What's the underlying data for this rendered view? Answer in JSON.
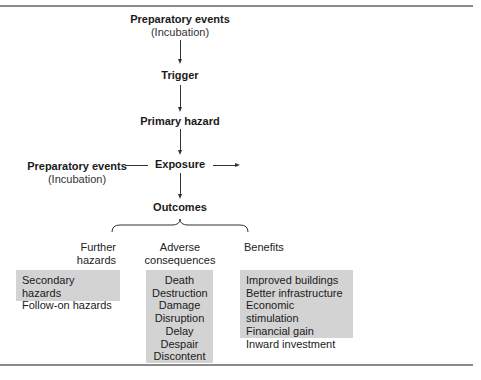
{
  "diagram": {
    "nodes": {
      "preparatory_top": {
        "label": "Preparatory events",
        "sublabel": "(Incubation)"
      },
      "trigger": {
        "label": "Trigger"
      },
      "primary_hazard": {
        "label": "Primary hazard"
      },
      "preparatory_left": {
        "label": "Preparatory events",
        "sublabel": "(Incubation)"
      },
      "exposure": {
        "label": "Exposure"
      },
      "outcomes": {
        "label": "Outcomes"
      }
    },
    "categories": [
      {
        "label_line1": "Further",
        "label_line2": "hazards",
        "items": [
          "Secondary hazards",
          "Follow-on hazards"
        ]
      },
      {
        "label_line1": "Adverse",
        "label_line2": "consequences",
        "items": [
          "Death",
          "Destruction",
          "Damage",
          "Disruption",
          "Delay",
          "Despair",
          "Discontent"
        ]
      },
      {
        "label_line1": "Benefits",
        "label_line2": "",
        "items": [
          "Improved buildings",
          "Better infrastructure",
          "Economic stimulation",
          "Financial gain",
          "Inward investment"
        ]
      }
    ],
    "colors": {
      "box_fill": "#d3d3d3",
      "line": "#333333",
      "rule": "#8a8a8a"
    }
  }
}
